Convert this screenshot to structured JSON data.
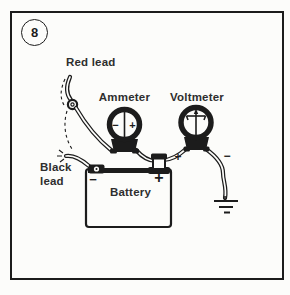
{
  "figure": {
    "number": "8",
    "labels": {
      "red_lead": "Red lead",
      "black_lead": "Black lead",
      "ammeter": "Ammeter",
      "voltmeter": "Voltmeter",
      "battery": "Battery"
    },
    "signs": {
      "ammeter_minus": "−",
      "ammeter_plus": "+",
      "positive_wire": "+",
      "negative_wire": "−",
      "battery_negative": "−",
      "battery_positive": "+"
    },
    "colors": {
      "ink": "#1c1c1c",
      "paper": "#fcfcfa",
      "label": "#2e2e2e"
    }
  }
}
